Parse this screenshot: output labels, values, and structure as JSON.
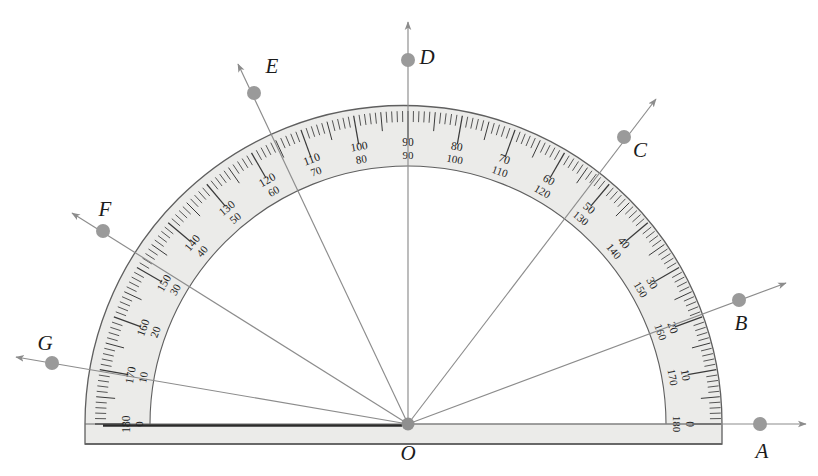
{
  "figure": {
    "kind": "protractor-diagram",
    "background_color": "#ffffff",
    "body_fill": "#ebebe9",
    "body_stroke": "#5f5f5f",
    "ray_color": "#8c8c8c",
    "dot_color": "#9a9a9a",
    "label_color": "#1b1b1b",
    "tick_color": "#3a3a3a"
  },
  "protractor": {
    "center": {
      "x": 408,
      "y": 424,
      "label": "O"
    },
    "outer_radius": 314,
    "scale_radius": 258,
    "base_left_x": 85,
    "base_right_x": 722,
    "base_bottom_y": 444,
    "major_step": 10,
    "minor_step": 2,
    "outer_scale_label": "outer",
    "inner_scale_label": "inner",
    "outer_numbers": [
      0,
      10,
      20,
      30,
      40,
      50,
      60,
      70,
      80,
      90,
      100,
      110,
      120,
      130,
      140,
      150,
      160,
      170,
      180
    ],
    "inner_numbers": [
      180,
      170,
      160,
      150,
      140,
      130,
      120,
      110,
      100,
      90,
      80,
      70,
      60,
      50,
      40,
      30,
      20,
      10,
      0
    ]
  },
  "vertex": {
    "name": "O",
    "label": "O",
    "x": 408,
    "y": 424,
    "label_x": 408,
    "label_y": 460
  },
  "rays": [
    {
      "id": "A",
      "label": "A",
      "angle_deg": 0,
      "dot_x": 760,
      "dot_y": 424,
      "tip_x": 806,
      "tip_y": 424,
      "label_x": 762,
      "label_y": 458
    },
    {
      "id": "B",
      "label": "B",
      "angle_deg": 20.5,
      "dot_x": 739,
      "dot_y": 300,
      "tip_x": 786,
      "tip_y": 283,
      "label_x": 741,
      "label_y": 330
    },
    {
      "id": "C",
      "label": "C",
      "angle_deg": 53.0,
      "dot_x": 624,
      "dot_y": 137,
      "tip_x": 656,
      "tip_y": 99,
      "label_x": 640,
      "label_y": 157
    },
    {
      "id": "D",
      "label": "D",
      "angle_deg": 90.0,
      "dot_x": 408,
      "dot_y": 60,
      "tip_x": 408,
      "tip_y": 22,
      "label_x": 427,
      "label_y": 64
    },
    {
      "id": "E",
      "label": "E",
      "angle_deg": 115.0,
      "dot_x": 254,
      "dot_y": 93,
      "tip_x": 238,
      "tip_y": 64,
      "label_x": 272,
      "label_y": 73
    },
    {
      "id": "F",
      "label": "F",
      "angle_deg": 147.7,
      "dot_x": 103,
      "dot_y": 231,
      "tip_x": 72,
      "tip_y": 213,
      "label_x": 105,
      "label_y": 216
    },
    {
      "id": "G",
      "label": "G",
      "angle_deg": 170.3,
      "dot_x": 52,
      "dot_y": 363,
      "tip_x": 16,
      "tip_y": 357,
      "label_x": 45,
      "label_y": 350
    }
  ],
  "chart_data": {
    "type": "scatter",
    "xlabel": "",
    "ylabel": "",
    "categories": [
      "A",
      "B",
      "C",
      "D",
      "E",
      "F",
      "G"
    ],
    "values": [
      0,
      20.5,
      53,
      90,
      115,
      147.7,
      170.3
    ],
    "series": [
      {
        "name": "ray angle (degrees, outer scale)",
        "values": [
          0,
          20.5,
          53,
          90,
          115,
          147.7,
          170.3
        ]
      },
      {
        "name": "ray angle (degrees, inner scale)",
        "values": [
          180,
          159.5,
          127,
          90,
          65,
          32.3,
          9.7
        ]
      }
    ],
    "axis_range": [
      0,
      180
    ],
    "grid": false,
    "legend": "none",
    "annotations": [
      "O is the vertex at the protractor origin",
      "Outer scale reads 0 at left, 180 at right",
      "Inner scale reads 180 at left, 0 at right"
    ]
  }
}
